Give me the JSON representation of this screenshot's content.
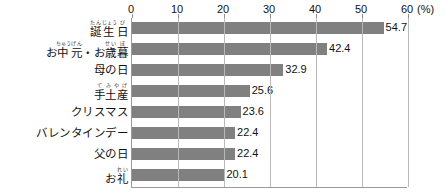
{
  "chart_data": {
    "type": "bar",
    "orientation": "horizontal",
    "title": "",
    "subtitle": "",
    "xlabel": "",
    "ylabel": "",
    "unit_label": "(%)",
    "xlim": [
      0,
      60
    ],
    "xticks": [
      0,
      10,
      20,
      30,
      40,
      50,
      60
    ],
    "xtick_labels": [
      "0",
      "10",
      "20",
      "30",
      "40",
      "50",
      "60"
    ],
    "grid": true,
    "legend": null,
    "bar_color": "#808080",
    "categories": [
      "誕生日",
      "お中元・お歳暮",
      "母の日",
      "手土産",
      "クリスマス",
      "バレンタインデー",
      "父の日",
      "お礼"
    ],
    "values": [
      54.7,
      42.4,
      32.9,
      25.6,
      23.6,
      22.4,
      22.4,
      20.1
    ],
    "value_labels": [
      "54.7",
      "42.4",
      "32.9",
      "25.6",
      "23.6",
      "22.4",
      "22.4",
      "20.1"
    ],
    "category_ruby": [
      [
        {
          "base": "誕",
          "rt": "たん"
        },
        {
          "base": "生",
          "rt": "じょう"
        },
        {
          "base": "日",
          "rt": "び"
        }
      ],
      [
        {
          "base": "お",
          "rt": ""
        },
        {
          "base": "中",
          "rt": "ちゅう"
        },
        {
          "base": "元",
          "rt": "げん"
        },
        {
          "base": "・",
          "rt": ""
        },
        {
          "base": "お",
          "rt": ""
        },
        {
          "base": "歳",
          "rt": "せい"
        },
        {
          "base": "暮",
          "rt": "ぼ"
        }
      ],
      [
        {
          "base": "母の日",
          "rt": ""
        }
      ],
      [
        {
          "base": "手",
          "rt": "て"
        },
        {
          "base": "土産",
          "rt": "みやげ"
        }
      ],
      [
        {
          "base": "クリスマス",
          "rt": ""
        }
      ],
      [
        {
          "base": "バレンタインデー",
          "rt": ""
        }
      ],
      [
        {
          "base": "父の日",
          "rt": ""
        }
      ],
      [
        {
          "base": "お",
          "rt": ""
        },
        {
          "base": "礼",
          "rt": "れい"
        }
      ]
    ]
  }
}
